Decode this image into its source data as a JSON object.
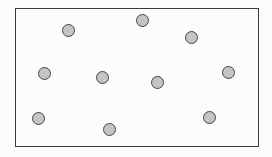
{
  "diagram": {
    "frame": {
      "left": 15,
      "top": 8,
      "right": 259,
      "bottom": 147,
      "stroke": "#3a3a3a"
    },
    "dot_fill": "#c4c4c4",
    "dot_stroke": "#444444",
    "dots": [
      {
        "x": 68,
        "y": 30
      },
      {
        "x": 142,
        "y": 20
      },
      {
        "x": 191,
        "y": 37
      },
      {
        "x": 44,
        "y": 73
      },
      {
        "x": 102,
        "y": 77
      },
      {
        "x": 157,
        "y": 82
      },
      {
        "x": 228,
        "y": 72
      },
      {
        "x": 38,
        "y": 118
      },
      {
        "x": 109,
        "y": 129
      },
      {
        "x": 209,
        "y": 117
      }
    ]
  }
}
